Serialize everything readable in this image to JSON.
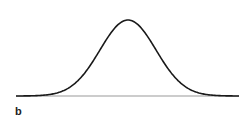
{
  "panel": {
    "label": "b"
  },
  "chart_data": {
    "type": "line",
    "title": "",
    "xlabel": "",
    "ylabel": "",
    "series": [
      {
        "name": "normal-distribution",
        "mean": 0,
        "std": 1,
        "x_range": [
          -4,
          4
        ]
      }
    ],
    "grid": false,
    "legend": false,
    "colors": {
      "curve": "#1a1a1a",
      "baseline": "#9a9a9a"
    }
  },
  "layout": {
    "baseline_y": 96,
    "x_left": 16,
    "x_right": 239,
    "peak_x": 128,
    "peak_y": 20,
    "sigma_px": 28
  }
}
